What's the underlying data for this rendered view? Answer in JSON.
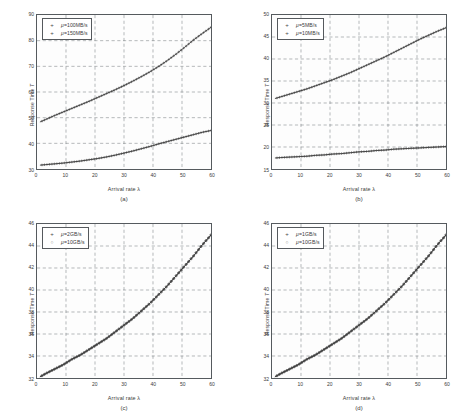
{
  "figure": {
    "panels": [
      {
        "id": "a",
        "caption": "(a)",
        "xlabel_prefix": "Arrival rate ",
        "xlabel_symbol": "λ",
        "ylabel_prefix": "Response Time ",
        "ylabel_symbol": "T",
        "legend": [
          {
            "marker": "+",
            "symbol": "μ",
            "text": "=100MB/s"
          },
          {
            "marker": "+",
            "symbol": "μ",
            "text": "=150MB/s"
          }
        ],
        "chart_data": {
          "type": "line",
          "title": "",
          "xlabel": "Arrival rate λ",
          "ylabel": "Response Time T",
          "xlim": [
            0,
            60
          ],
          "ylim": [
            30,
            90
          ],
          "xticks": [
            0,
            10,
            20,
            30,
            40,
            50,
            60
          ],
          "yticks": [
            30,
            40,
            50,
            60,
            70,
            80,
            90
          ],
          "grid": true,
          "legend_position": "upper-left",
          "x": [
            1,
            3,
            6,
            9,
            12,
            15,
            18,
            21,
            24,
            27,
            30,
            33,
            36,
            39,
            42,
            45,
            48,
            51,
            54,
            57,
            60
          ],
          "series": [
            {
              "name": "μ=100MB/s",
              "marker": "+",
              "values": [
                48.3,
                49.3,
                50.8,
                52.2,
                53.6,
                55.0,
                56.4,
                57.9,
                59.4,
                60.9,
                62.5,
                64.2,
                66.0,
                67.9,
                70.0,
                72.3,
                74.8,
                77.5,
                80.3,
                82.8,
                85.2
              ]
            },
            {
              "name": "μ=150MB/s",
              "marker": "+",
              "values": [
                31.5,
                31.7,
                32.0,
                32.3,
                32.7,
                33.1,
                33.6,
                34.1,
                34.7,
                35.4,
                36.2,
                37.0,
                37.9,
                38.8,
                39.8,
                40.7,
                41.6,
                42.5,
                43.4,
                44.3,
                45.0
              ]
            }
          ]
        }
      },
      {
        "id": "b",
        "caption": "(b)",
        "xlabel_prefix": "Arrival rate ",
        "xlabel_symbol": "λ",
        "ylabel_prefix": "Response Time ",
        "ylabel_symbol": "T",
        "legend": [
          {
            "marker": "+",
            "symbol": "μ",
            "text": "=5MB/s"
          },
          {
            "marker": "+",
            "symbol": "μ",
            "text": "=10MB/s"
          }
        ],
        "chart_data": {
          "type": "line",
          "title": "",
          "xlabel": "Arrival rate λ",
          "ylabel": "Response Time T",
          "xlim": [
            0,
            60
          ],
          "ylim": [
            15,
            50
          ],
          "xticks": [
            0,
            10,
            20,
            30,
            40,
            50,
            60
          ],
          "yticks": [
            15,
            20,
            25,
            30,
            35,
            40,
            45,
            50
          ],
          "grid": true,
          "legend_position": "upper-left",
          "x": [
            1,
            3,
            6,
            9,
            12,
            15,
            18,
            21,
            24,
            27,
            30,
            33,
            36,
            39,
            42,
            45,
            48,
            51,
            54,
            57,
            60
          ],
          "series": [
            {
              "name": "μ=5MB/s",
              "marker": "+",
              "values": [
                31.0,
                31.4,
                32.0,
                32.6,
                33.2,
                33.9,
                34.6,
                35.3,
                36.1,
                36.9,
                37.8,
                38.7,
                39.6,
                40.5,
                41.5,
                42.5,
                43.5,
                44.5,
                45.4,
                46.3,
                47.1
              ]
            },
            {
              "name": "μ=10MB/s",
              "marker": "+",
              "values": [
                17.5,
                17.6,
                17.7,
                17.8,
                17.9,
                18.1,
                18.2,
                18.4,
                18.5,
                18.7,
                18.9,
                19.0,
                19.2,
                19.3,
                19.5,
                19.6,
                19.7,
                19.8,
                19.9,
                20.0,
                20.1
              ]
            }
          ]
        }
      },
      {
        "id": "c",
        "caption": "(c)",
        "xlabel_prefix": "Arrival rate ",
        "xlabel_symbol": "λ",
        "ylabel_prefix": "Response Time ",
        "ylabel_symbol": "T",
        "legend": [
          {
            "marker": "+",
            "symbol": "μ",
            "text": "=2GB/s"
          },
          {
            "marker": "○",
            "symbol": "μ",
            "text": "=10GB/s"
          }
        ],
        "chart_data": {
          "type": "line",
          "title": "",
          "xlabel": "Arrival rate λ",
          "ylabel": "Response Time T",
          "xlim": [
            0,
            60
          ],
          "ylim": [
            32,
            46
          ],
          "xticks": [
            0,
            10,
            20,
            30,
            40,
            50,
            60
          ],
          "yticks": [
            32,
            34,
            36,
            38,
            40,
            42,
            44,
            46
          ],
          "grid": true,
          "legend_position": "upper-left",
          "x": [
            1,
            3,
            6,
            9,
            12,
            15,
            18,
            21,
            24,
            27,
            30,
            33,
            36,
            39,
            42,
            45,
            48,
            51,
            54,
            57,
            60
          ],
          "series": [
            {
              "name": "μ=2GB/s",
              "marker": "+",
              "values": [
                32.1,
                32.4,
                32.8,
                33.2,
                33.7,
                34.1,
                34.6,
                35.1,
                35.6,
                36.2,
                36.8,
                37.4,
                38.1,
                38.8,
                39.6,
                40.4,
                41.3,
                42.2,
                43.1,
                44.1,
                45.0
              ]
            },
            {
              "name": "μ=10GB/s",
              "marker": "○",
              "values": [
                32.1,
                32.4,
                32.8,
                33.2,
                33.7,
                34.1,
                34.6,
                35.1,
                35.6,
                36.2,
                36.8,
                37.4,
                38.1,
                38.8,
                39.6,
                40.4,
                41.3,
                42.2,
                43.1,
                44.1,
                45.0
              ]
            }
          ]
        }
      },
      {
        "id": "d",
        "caption": "(d)",
        "xlabel_prefix": "Arrival rate ",
        "xlabel_symbol": "λ",
        "ylabel_prefix": "Response Time ",
        "ylabel_symbol": "T",
        "legend": [
          {
            "marker": "+",
            "symbol": "μ",
            "text": "=1GB/s"
          },
          {
            "marker": "○",
            "symbol": "μ",
            "text": "=10GB/s"
          }
        ],
        "chart_data": {
          "type": "line",
          "title": "",
          "xlabel": "Arrival rate λ",
          "ylabel": "Response Time T",
          "xlim": [
            0,
            60
          ],
          "ylim": [
            32,
            46
          ],
          "xticks": [
            0,
            10,
            20,
            30,
            40,
            50,
            60
          ],
          "yticks": [
            32,
            34,
            36,
            38,
            40,
            42,
            44,
            46
          ],
          "grid": true,
          "legend_position": "upper-left",
          "x": [
            1,
            3,
            6,
            9,
            12,
            15,
            18,
            21,
            24,
            27,
            30,
            33,
            36,
            39,
            42,
            45,
            48,
            51,
            54,
            57,
            60
          ],
          "series": [
            {
              "name": "μ=1GB/s",
              "marker": "+",
              "values": [
                32.1,
                32.4,
                32.8,
                33.2,
                33.7,
                34.1,
                34.6,
                35.1,
                35.6,
                36.2,
                36.8,
                37.4,
                38.1,
                38.8,
                39.6,
                40.4,
                41.3,
                42.2,
                43.1,
                44.1,
                45.0
              ]
            },
            {
              "name": "μ=10GB/s",
              "marker": "○",
              "values": [
                32.1,
                32.4,
                32.8,
                33.2,
                33.7,
                34.1,
                34.6,
                35.1,
                35.6,
                36.2,
                36.8,
                37.4,
                38.1,
                38.8,
                39.6,
                40.4,
                41.3,
                42.2,
                43.1,
                44.1,
                45.0
              ]
            }
          ]
        }
      }
    ],
    "colors": {
      "axis": "#55595d",
      "grid": "#6d7276",
      "curve": "#3c3c3c",
      "background": "#ffffff"
    }
  }
}
